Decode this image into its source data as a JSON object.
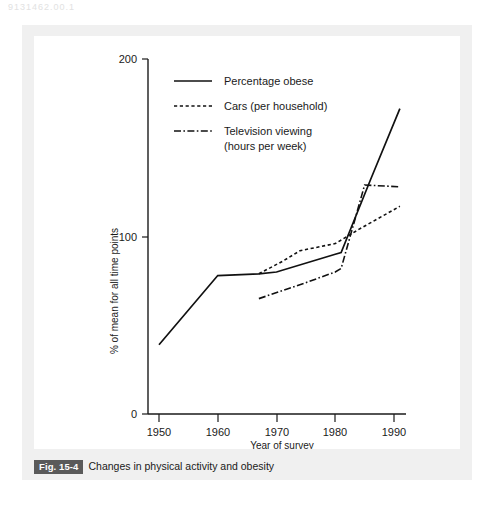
{
  "page": {
    "corner_text": "9131462.00.1"
  },
  "figure": {
    "number_label": "Fig. 15-4",
    "caption": "Changes in physical activity and obesity"
  },
  "chart_data": {
    "type": "line",
    "title": "",
    "xlabel": "Year of survey",
    "ylabel": "% of mean for all time points",
    "xlim": [
      1948,
      1992
    ],
    "ylim": [
      0,
      200
    ],
    "xticks": [
      1950,
      1960,
      1970,
      1980,
      1990
    ],
    "xtick_labels": [
      "1950",
      "1960",
      "1970",
      "1980",
      "1990"
    ],
    "yticks": [
      0,
      100,
      200
    ],
    "ytick_labels": [
      "0",
      "100",
      "200"
    ],
    "grid": false,
    "legend_position": "top-left-inside",
    "series": [
      {
        "name": "Percentage obese",
        "style": "solid",
        "x": [
          1950,
          1960,
          1967,
          1970,
          1980,
          1981,
          1986,
          1991
        ],
        "values": [
          39,
          78,
          79,
          80,
          90,
          91,
          132,
          172
        ]
      },
      {
        "name": "Cars (per household)",
        "style": "dashed",
        "x": [
          1967,
          1971,
          1974,
          1980,
          1984,
          1991
        ],
        "values": [
          79,
          86,
          92,
          96,
          104,
          117
        ]
      },
      {
        "name": "Television viewing (hours per week)",
        "style": "dash-dot",
        "x": [
          1967,
          1975,
          1980,
          1981,
          1985,
          1991
        ],
        "values": [
          65,
          74,
          80,
          82,
          129,
          128
        ]
      }
    ]
  },
  "legend": {
    "items": [
      {
        "label": "Percentage obese",
        "style": "solid"
      },
      {
        "label": "Cars (per household)",
        "style": "dashed"
      },
      {
        "label": "Television viewing",
        "label2": "(hours per week)",
        "style": "dash-dot"
      }
    ]
  }
}
